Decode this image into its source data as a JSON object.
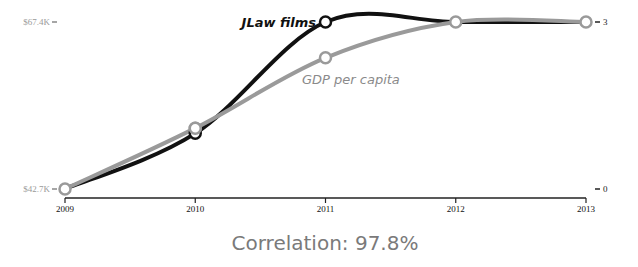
{
  "chart_data": {
    "type": "line",
    "title": "",
    "x": [
      2009,
      2010,
      2011,
      2012,
      2013
    ],
    "x_tick_labels": [
      "2009",
      "2010",
      "2011",
      "2012",
      "2013"
    ],
    "series": [
      {
        "name": "JLaw films",
        "axis": "right",
        "color": "#111111",
        "values": [
          0,
          1,
          3,
          3,
          3
        ]
      },
      {
        "name": "GDP per capita",
        "axis": "left",
        "color": "#9a9a9a",
        "values": [
          42.7,
          51.7,
          62.1,
          67.4,
          67.4
        ]
      }
    ],
    "left_axis": {
      "min": 42.7,
      "max": 67.4,
      "tick_labels": [
        "$42.7K",
        "$67.4K"
      ]
    },
    "right_axis": {
      "min": 0,
      "max": 3,
      "tick_labels": [
        "0",
        "3"
      ]
    },
    "annotation": "Correlation: 97.8%",
    "grid": false,
    "legend": "inline-labels"
  }
}
